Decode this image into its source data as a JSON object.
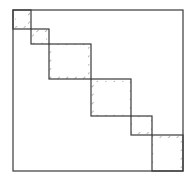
{
  "diagram": {
    "type": "block-diagonal-matrix",
    "outer": {
      "x": 13,
      "y": 10,
      "w": 170,
      "h": 161
    },
    "line_color": "#3a3a3a",
    "hatch_color": "#888888",
    "blocks": [
      {
        "x": 13,
        "y": 10,
        "w": 18,
        "h": 19
      },
      {
        "x": 31,
        "y": 29,
        "w": 18,
        "h": 15
      },
      {
        "x": 49,
        "y": 44,
        "w": 42,
        "h": 35
      },
      {
        "x": 91,
        "y": 79,
        "w": 40,
        "h": 37
      },
      {
        "x": 131,
        "y": 116,
        "w": 21,
        "h": 19
      },
      {
        "x": 152,
        "y": 135,
        "w": 31,
        "h": 36
      }
    ]
  }
}
